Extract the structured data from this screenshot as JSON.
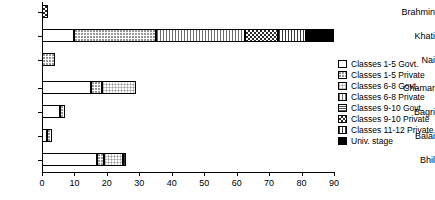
{
  "chart_data": {
    "type": "bar",
    "orientation": "horizontal",
    "stacked": true,
    "title": "",
    "xlabel": "",
    "ylabel": "",
    "xlim": [
      0,
      90
    ],
    "xticks": [
      0,
      10,
      20,
      30,
      40,
      50,
      60,
      70,
      80,
      90
    ],
    "xtick_labels": [
      "0",
      "10",
      "20",
      "30",
      "40",
      "50",
      "60",
      "70",
      "80",
      "90"
    ],
    "grid": false,
    "legend_position": "right",
    "categories": [
      "Brahmin",
      "Khati",
      "Nai",
      "Chamar",
      "Bagri",
      "Balai",
      "Bhil"
    ],
    "series": [
      {
        "name": "Classes 1-5 Govt.",
        "key": "govt15",
        "pattern": "solid-white",
        "values": [
          0,
          10,
          0,
          15,
          5.5,
          1.5,
          17
        ]
      },
      {
        "name": "Classes 1-5 Private",
        "key": "priv15",
        "pattern": "fine-dots",
        "values": [
          0,
          25,
          4,
          3.5,
          1.5,
          1.5,
          2
        ]
      },
      {
        "name": "Classes 6-8 Govt.",
        "key": "govt68",
        "pattern": "light-grid",
        "values": [
          0,
          0,
          0,
          10.5,
          0,
          0,
          6
        ]
      },
      {
        "name": "Classes 6-8 Private",
        "key": "priv68",
        "pattern": "vertical-lines",
        "values": [
          0,
          27.5,
          0,
          0,
          0,
          0,
          0
        ]
      },
      {
        "name": "Classes 9-10 Govt.",
        "key": "govt910",
        "pattern": "dense-grid",
        "values": [
          0,
          0,
          0,
          0,
          0,
          0,
          0
        ]
      },
      {
        "name": "Classes 9-10 Private",
        "key": "priv910",
        "pattern": "checkerboard",
        "values": [
          2,
          10.2,
          0,
          0,
          0,
          0,
          0
        ]
      },
      {
        "name": "Classes 11-12 Private",
        "key": "priv1112",
        "pattern": "coarse-grid",
        "values": [
          0,
          8.7,
          0,
          0,
          0,
          0,
          1
        ]
      },
      {
        "name": "Univ. stage",
        "key": "univ",
        "pattern": "solid-black",
        "values": [
          0,
          8.6,
          0,
          0,
          0,
          0,
          0
        ]
      }
    ],
    "totals": [
      2,
      90,
      4,
      29,
      7,
      3,
      26
    ]
  },
  "legend": {
    "items": [
      {
        "label": "Classes 1-5 Govt.",
        "key": "govt15"
      },
      {
        "label": "Classes 1-5 Private",
        "key": "priv15"
      },
      {
        "label": "Classes 6-8 Govt.",
        "key": "govt68"
      },
      {
        "label": "Classes 6-8 Private",
        "key": "priv68"
      },
      {
        "label": "Classes 9-10 Govt.",
        "key": "govt910"
      },
      {
        "label": "Classes 9-10 Private",
        "key": "priv910"
      },
      {
        "label": "Classes 11-12 Private",
        "key": "priv1112"
      },
      {
        "label": "Univ. stage",
        "key": "univ"
      }
    ]
  },
  "colors": {
    "axis": "#000000",
    "background": "#ffffff",
    "text": "#000000",
    "univ_stage": "#000000"
  }
}
